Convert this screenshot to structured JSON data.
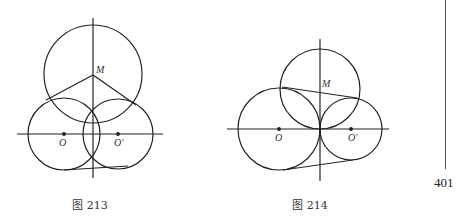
{
  "page": {
    "top_text_clipped": "——————————————————————",
    "page_number": "401"
  },
  "figures": [
    {
      "id": "fig213",
      "caption": "图 213",
      "labels": {
        "center_top": "M",
        "left_center": "O",
        "right_center": "O′"
      }
    },
    {
      "id": "fig214",
      "caption": "图 214",
      "labels": {
        "center_top": "M",
        "left_center": "O",
        "right_center": "O′"
      }
    }
  ]
}
